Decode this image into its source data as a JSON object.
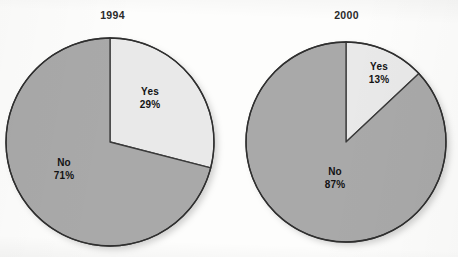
{
  "figure": {
    "background_color": "#fdfdfc",
    "slice_fill_yes": "#e9e9e9",
    "slice_fill_no": "#a9a9a9",
    "outline_color": "#3a3a3a",
    "label_color": "#131313"
  },
  "charts": [
    {
      "title": "1994",
      "center_x": 110,
      "center_y": 142,
      "radius": 104,
      "slices": [
        {
          "name": "Yes",
          "label": "Yes",
          "percent_text": "29%",
          "value": 29,
          "fill": "#e9e9e9",
          "start_deg": 0,
          "sweep_deg": 104.4
        },
        {
          "name": "No",
          "label": "No",
          "percent_text": "71%",
          "value": 71,
          "fill": "#a9a9a9",
          "start_deg": 104.4,
          "sweep_deg": 255.6
        }
      ]
    },
    {
      "title": "2000",
      "center_x": 346,
      "center_y": 142,
      "radius": 100,
      "slices": [
        {
          "name": "Yes",
          "label": "Yes",
          "percent_text": "13%",
          "value": 13,
          "fill": "#e9e9e9",
          "start_deg": 0,
          "sweep_deg": 46.8
        },
        {
          "name": "No",
          "label": "No",
          "percent_text": "87%",
          "value": 87,
          "fill": "#a9a9a9",
          "start_deg": 46.8,
          "sweep_deg": 313.2
        }
      ]
    }
  ],
  "chart_data": {
    "type": "pie",
    "title": "",
    "subtitle": "",
    "xlabel": "",
    "ylabel": "",
    "legend_position": "none",
    "grid": false,
    "panels": [
      {
        "title": "1994",
        "labels": [
          "Yes",
          "No"
        ],
        "values": [
          29,
          71
        ],
        "value_suffix": "%",
        "colors": [
          "#e9e9e9",
          "#a9a9a9"
        ],
        "start_angle_deg": 90,
        "direction": "clockwise",
        "data_labels": [
          "Yes 29%",
          "No 71%"
        ]
      },
      {
        "title": "2000",
        "labels": [
          "Yes",
          "No"
        ],
        "values": [
          13,
          87
        ],
        "value_suffix": "%",
        "colors": [
          "#e9e9e9",
          "#a9a9a9"
        ],
        "start_angle_deg": 90,
        "direction": "clockwise",
        "data_labels": [
          "Yes 13%",
          "No 87%"
        ]
      }
    ]
  }
}
